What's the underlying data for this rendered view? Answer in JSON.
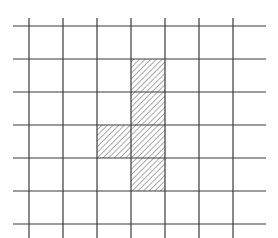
{
  "diagram": {
    "type": "grid-with-shaded-cells",
    "grid": {
      "vertical_lines_x": [
        29,
        63,
        97,
        131,
        165,
        199,
        233
      ],
      "vertical_line_y_range": [
        18,
        238
      ],
      "horizontal_lines_y": [
        26,
        59,
        92,
        125,
        158,
        191,
        224
      ],
      "horizontal_line_x_range": [
        13,
        266
      ],
      "line_color": "#3a3a3a",
      "line_width": 1.2
    },
    "hatched_cells": [
      {
        "col": 3,
        "row": 1,
        "x": 131,
        "y": 59,
        "w": 34,
        "h": 33
      },
      {
        "col": 3,
        "row": 2,
        "x": 131,
        "y": 92,
        "w": 34,
        "h": 33
      },
      {
        "col": 3,
        "row": 3,
        "x": 131,
        "y": 125,
        "w": 34,
        "h": 33
      },
      {
        "col": 2,
        "row": 3,
        "x": 97,
        "y": 125,
        "w": 34,
        "h": 33
      },
      {
        "col": 3,
        "row": 4,
        "x": 131,
        "y": 158,
        "w": 34,
        "h": 33
      }
    ],
    "hatch": {
      "pattern": "diagonal-forward-slash",
      "spacing": 4,
      "color": "#555555"
    }
  }
}
